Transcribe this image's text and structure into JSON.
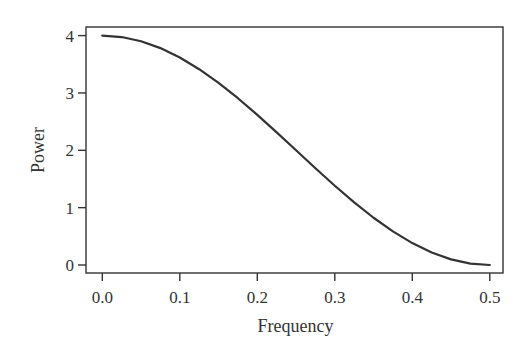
{
  "chart_data": {
    "type": "line",
    "title": "",
    "xlabel": "Frequency",
    "ylabel": "Power",
    "xlim": [
      0.0,
      0.5
    ],
    "ylim": [
      0,
      4
    ],
    "x_ticks": [
      0.0,
      0.1,
      0.2,
      0.3,
      0.4,
      0.5
    ],
    "x_tick_labels": [
      "0.0",
      "0.1",
      "0.2",
      "0.3",
      "0.4",
      "0.5"
    ],
    "y_ticks": [
      0,
      1,
      2,
      3,
      4
    ],
    "y_tick_labels": [
      "0",
      "1",
      "2",
      "3",
      "4"
    ],
    "grid": false,
    "legend": null,
    "series": [
      {
        "name": "spectrum",
        "color": "#333333",
        "x": [
          0.0,
          0.025,
          0.05,
          0.075,
          0.1,
          0.125,
          0.15,
          0.175,
          0.2,
          0.225,
          0.25,
          0.275,
          0.3,
          0.325,
          0.35,
          0.375,
          0.4,
          0.425,
          0.45,
          0.475,
          0.5
        ],
        "values": [
          4.0,
          3.975,
          3.902,
          3.782,
          3.618,
          3.414,
          3.176,
          2.908,
          2.618,
          2.313,
          2.0,
          1.687,
          1.382,
          1.092,
          0.824,
          0.586,
          0.382,
          0.218,
          0.098,
          0.025,
          0.0
        ]
      }
    ]
  },
  "colors": {
    "line": "#333333",
    "frame": "#333333",
    "text": "#333333",
    "background": "#ffffff"
  }
}
